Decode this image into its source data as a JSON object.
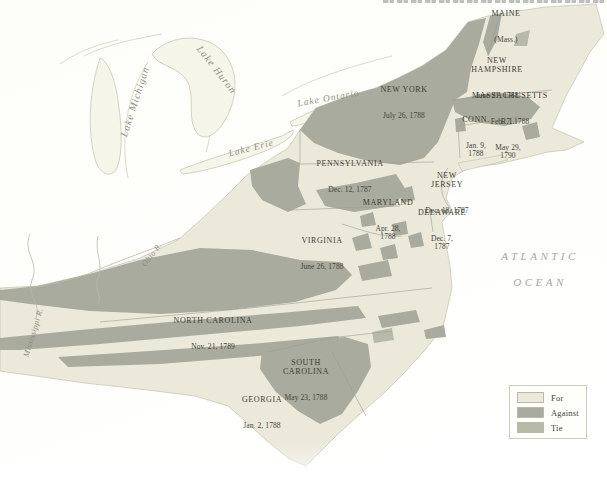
{
  "map": {
    "states": [
      {
        "name": "MAINE",
        "note": "(Mass.)"
      },
      {
        "name": "NEW\nHAMPSHIRE",
        "date": "June 21, 1788"
      },
      {
        "name": "NEW YORK",
        "date": "July 26, 1788"
      },
      {
        "name": "MASSACHUSETTS",
        "date": "Feb. 7, 1788"
      },
      {
        "name": "CONN.",
        "date": "Jan. 9,\n1788"
      },
      {
        "name": "R.I.",
        "date": "May 29,\n1790"
      },
      {
        "name": "PENNSYLVANIA",
        "date": "Dec. 12, 1787"
      },
      {
        "name": "NEW\nJERSEY",
        "date": "Dec. 18, 1787"
      },
      {
        "name": "MARYLAND",
        "date": "Apr. 28,\n1788"
      },
      {
        "name": "DELAWARE",
        "date": "Dec. 7,\n1787"
      },
      {
        "name": "VIRGINIA",
        "date": "June 26, 1788"
      },
      {
        "name": "NORTH CAROLINA",
        "date": "Nov. 21, 1789"
      },
      {
        "name": "SOUTH\nCAROLINA",
        "date": "May 23, 1788"
      },
      {
        "name": "GEORGIA",
        "date": "Jan. 2, 1788"
      }
    ],
    "water": {
      "lakes": [
        "Lake Michigan",
        "Lake Huron",
        "Lake Ontario",
        "Lake Erie"
      ],
      "rivers": [
        "Ohio R.",
        "Mississippi R."
      ],
      "ocean_lines": "ATLANTIC\nOCEAN"
    },
    "legend": {
      "items": [
        {
          "label": "For",
          "color": "#ebe9da"
        },
        {
          "label": "Against",
          "color": "#a8ab9e"
        },
        {
          "label": "Tie",
          "color": "#b7baa9"
        }
      ]
    }
  }
}
